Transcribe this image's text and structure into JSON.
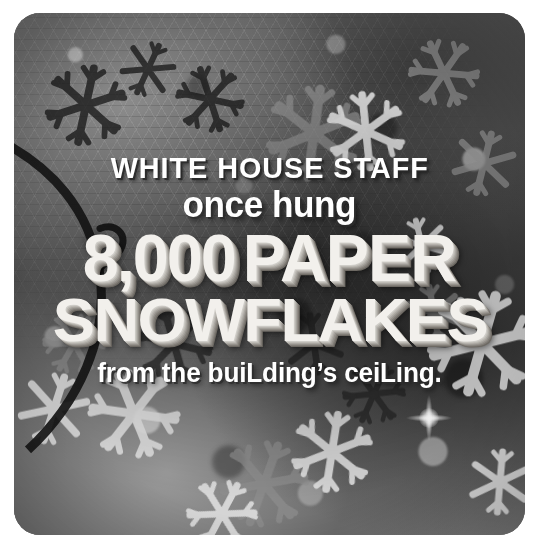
{
  "card": {
    "background_description": "grayscale photograph of many overlapping hand-cut paper snowflakes hanging from a ceiling, with hexagonal netting and a dark curved hoop at the left",
    "corner_radius_px": 26,
    "border_color": "#ffffff"
  },
  "caption": {
    "line_1": "WHITE HOUSE STAFF",
    "line_2": "once hung",
    "line_3_number": "8,000",
    "line_3_word": "PAPER",
    "line_4": "SNOWFLAKES",
    "line_5_a": "from the bui",
    "line_5_b": "L",
    "line_5_c": "ding’s cei",
    "line_5_d": "L",
    "line_5_e": "ing.",
    "line_5_full": "from the building’s ceiling."
  },
  "colors": {
    "text": "#ffffff",
    "text_3d_face": "#f2f0ec",
    "text_3d_shadow": "#6d6963",
    "frame": "#ffffff"
  },
  "decor": {
    "flare_name": "light-flare-starburst"
  }
}
